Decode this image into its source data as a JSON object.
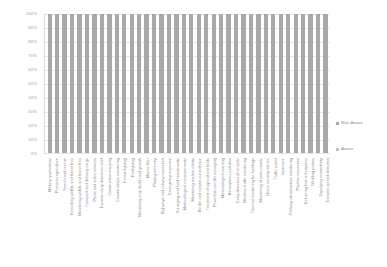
{
  "chart_data": {
    "type": "bar",
    "title": "",
    "subtitle": "",
    "xlabel": "",
    "ylabel": "",
    "ylim": [
      0,
      100
    ],
    "grid": true,
    "legend_position": "right",
    "stacked": true,
    "y_ticks": [
      "100%",
      "90%",
      "80%",
      "70%",
      "60%",
      "50%",
      "40%",
      "30%",
      "20%",
      "10%",
      "0%"
    ],
    "y_tick_values": [
      100,
      90,
      80,
      70,
      60,
      50,
      40,
      30,
      20,
      10,
      0
    ],
    "categories": [
      "Military applications",
      "Precision agriculture",
      "Search and rescue",
      "Recording wildlife and forest fires",
      "Monitoring wildlife and forest fires",
      "Transport and delivery cargo",
      "Photo and video services",
      "Disaster early detection relief",
      "Construction mapping",
      "Coastal shape monitoring",
      "Forest fighting",
      "Firefighting",
      "Monitoring crop health and growth",
      "Marine litter",
      "Photogrammetry",
      "Highways and railway inspection",
      "Emergency response",
      "Surveying and land investments",
      "Meteorological measurements",
      "Monitoring nuclear plants",
      "Border and coastal surveillance",
      "Treatment of agricultural fields",
      "Powerline corridor surveying",
      "Meteorological warning",
      "Atmospheric pollution",
      "Early detection of oil spills",
      "Maritime traffic monitoring",
      "Thermal monitoring for buildings",
      "Monitoring of solar panels",
      "Home security alarms",
      "Traffic patrol",
      "Insurance",
      "Railway infrastructure monitoring",
      "Pipeline inspection",
      "Delivering first aid supplies",
      "Wedding parties",
      "Supplying connectivity",
      "Disaster spread detection"
    ],
    "series": [
      {
        "name": "Non-Aware",
        "color": "#a9a9a9",
        "values": [
          100,
          100,
          100,
          100,
          100,
          100,
          100,
          100,
          100,
          100,
          100,
          100,
          100,
          100,
          100,
          100,
          100,
          100,
          100,
          100,
          100,
          100,
          100,
          100,
          100,
          100,
          100,
          100,
          100,
          100,
          100,
          100,
          100,
          100,
          100,
          100,
          100,
          100
        ]
      },
      {
        "name": "Aware",
        "color": "#c0c0c0",
        "values": [
          0,
          0,
          0,
          0,
          0,
          0,
          0,
          0,
          0,
          0,
          0,
          0,
          0,
          0,
          0,
          0,
          0,
          0,
          0,
          0,
          0,
          0,
          0,
          0,
          0,
          0,
          0,
          0,
          0,
          0,
          0,
          0,
          0,
          0,
          0,
          0,
          0,
          0
        ]
      }
    ]
  },
  "legend": {
    "items": [
      {
        "label": "Non-Aware",
        "color": "#a9a9a9"
      },
      {
        "label": "Aware",
        "color": "#c0c0c0"
      }
    ]
  }
}
